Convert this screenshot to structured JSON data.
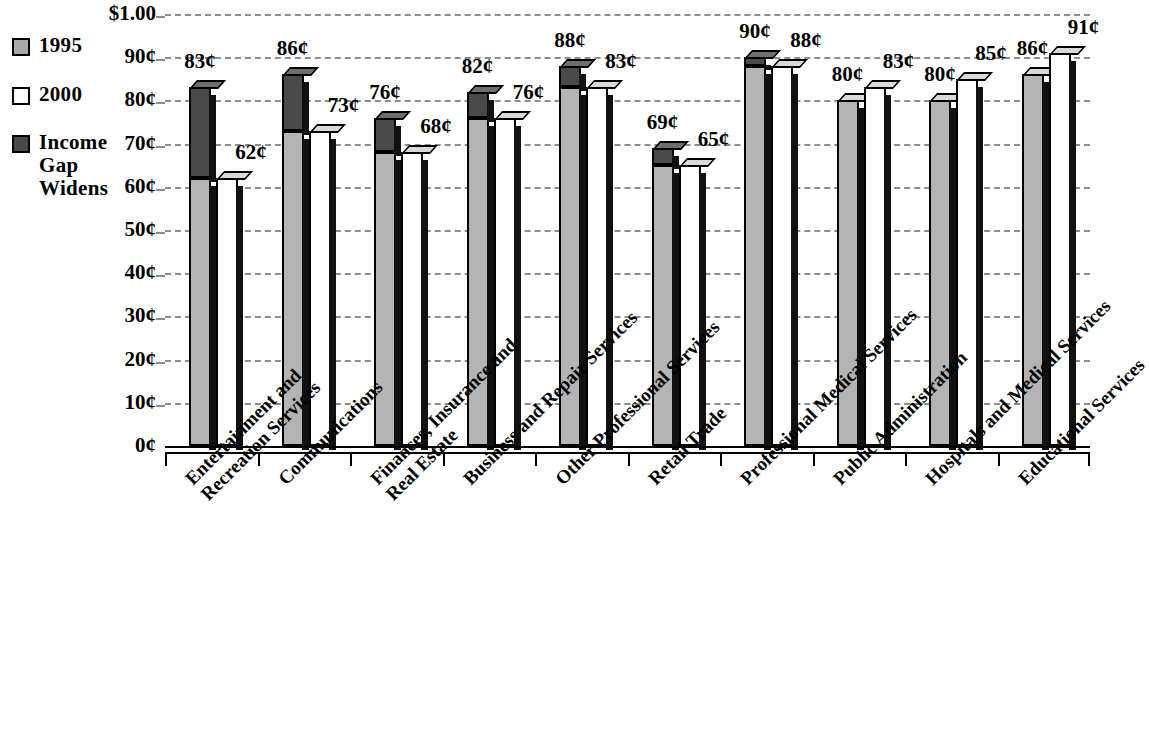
{
  "legend": {
    "items": [
      {
        "label": "1995",
        "swatch": "#a8a8a8",
        "name": "legend-item-1995"
      },
      {
        "label": "2000",
        "swatch": "#ffffff",
        "name": "legend-item-2000"
      },
      {
        "label": "Income\nGap\nWidens",
        "swatch": "#4a4a4a",
        "name": "legend-item-income-gap-widens"
      }
    ]
  },
  "axis": {
    "y_ticks": [
      "$1.00",
      "90¢",
      "80¢",
      "70¢",
      "60¢",
      "50¢",
      "40¢",
      "30¢",
      "20¢",
      "10¢",
      "0¢"
    ]
  },
  "chart_data": {
    "type": "bar",
    "title": "",
    "xlabel": "",
    "ylabel": "",
    "ylim": [
      0,
      100
    ],
    "ytick_values": [
      100,
      90,
      80,
      70,
      60,
      50,
      40,
      30,
      20,
      10,
      0
    ],
    "ytick_labels": [
      "$1.00",
      "90¢",
      "80¢",
      "70¢",
      "60¢",
      "50¢",
      "40¢",
      "30¢",
      "20¢",
      "10¢",
      "0¢"
    ],
    "grid": true,
    "legend_position": "left",
    "categories": [
      "Entertainment and\nRecreation Services",
      "Communications",
      "Finances, Insurance and\nReal Estate",
      "Business and Repair Services",
      "Other Professional Services",
      "Retail Trade",
      "Professional Medical Services",
      "Public Administration",
      "Hospitals and Medical Services",
      "Educational Services"
    ],
    "series": [
      {
        "name": "1995",
        "color": "#a8a8a8",
        "values": [
          83,
          86,
          76,
          82,
          88,
          69,
          90,
          80,
          80,
          86
        ],
        "labels": [
          "83¢",
          "86¢",
          "76¢",
          "82¢",
          "88¢",
          "69¢",
          "90¢",
          "80¢",
          "80¢",
          "86¢"
        ]
      },
      {
        "name": "2000",
        "color": "#ffffff",
        "values": [
          62,
          73,
          68,
          76,
          83,
          65,
          88,
          83,
          85,
          91
        ],
        "labels": [
          "62¢",
          "73¢",
          "68¢",
          "76¢",
          "83¢",
          "65¢",
          "88¢",
          "83¢",
          "85¢",
          "91¢"
        ]
      }
    ],
    "income_gap_widens": {
      "name": "Income Gap Widens",
      "color": "#4a4a4a",
      "description": "Dark overlay on the 1995 bar spanning from the 2000 value up to the 1995 value where 1995 exceeds 2000.",
      "values": [
        21,
        13,
        8,
        6,
        5,
        4,
        2,
        0,
        0,
        0
      ]
    }
  }
}
